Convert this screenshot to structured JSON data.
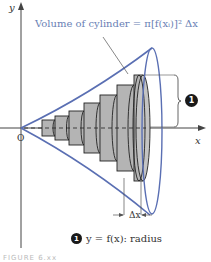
{
  "diagram": {
    "axes": {
      "x_label": "x",
      "y_label": "y",
      "origin_label": "O"
    },
    "formula_label": "Volume of cylinder = π[f(xᵢ)]² Δx",
    "delta_label": "Δx",
    "callout_number": "1",
    "legend": {
      "number": "1",
      "text": "y = f(x): radius"
    },
    "caption": "FIGURE 6.xx",
    "colors": {
      "curve": "#5a6fb3",
      "cylinder_fill": "#b4b4b4",
      "axis": "#444444",
      "formula_text": "#6a7fb5"
    },
    "cylinders": [
      {
        "x0": 42,
        "x1": 55,
        "r": 8
      },
      {
        "x0": 55,
        "x1": 69,
        "r": 12
      },
      {
        "x0": 69,
        "x1": 84,
        "r": 17
      },
      {
        "x0": 84,
        "x1": 100,
        "r": 25
      },
      {
        "x0": 100,
        "x1": 117,
        "r": 33
      },
      {
        "x0": 117,
        "x1": 134,
        "r": 43
      },
      {
        "x0": 134,
        "x1": 145,
        "r": 53
      }
    ]
  }
}
